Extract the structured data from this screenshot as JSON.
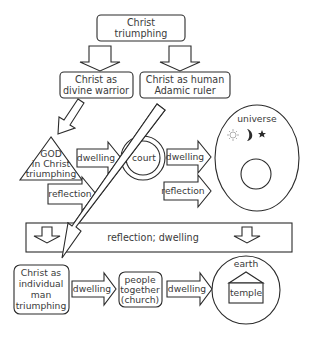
{
  "diagram": {
    "top_node": {
      "line1": "Christ",
      "line2": "triumphing"
    },
    "left_node": {
      "line1": "Christ as",
      "line2": "divine warrior"
    },
    "right_node": {
      "line1": "Christ as human",
      "line2": "Adamic ruler"
    },
    "triangle_node": {
      "line1": "GOD",
      "line2": "in Christ",
      "line3": "triumphing"
    },
    "court_node": {
      "label": "court"
    },
    "universe_node": {
      "label": "universe",
      "icons": [
        "sun-icon",
        "moon-icon",
        "star-icon"
      ]
    },
    "arrows_upper": {
      "tri_to_court": "dwelling",
      "tri_reflection": "reflection",
      "court_to_universe": "dwelling",
      "court_reflection": "reflection"
    },
    "band": {
      "label": "reflection; dwelling"
    },
    "bottom_left_node": {
      "line1": "Christ as",
      "line2": "individual",
      "line3": "man",
      "line4": "triumphing"
    },
    "bottom_middle_node": {
      "line1": "people",
      "line2": "together",
      "line3": "(church)"
    },
    "earth_node": {
      "label": "earth",
      "temple_label": "temple"
    },
    "arrows_lower": {
      "man_to_people": "dwelling",
      "people_to_earth": "dwelling"
    }
  },
  "colors": {
    "stroke": "#2b2b2b",
    "text": "#3a3a3a",
    "background": "#ffffff",
    "sun": "#b0b0b0"
  }
}
